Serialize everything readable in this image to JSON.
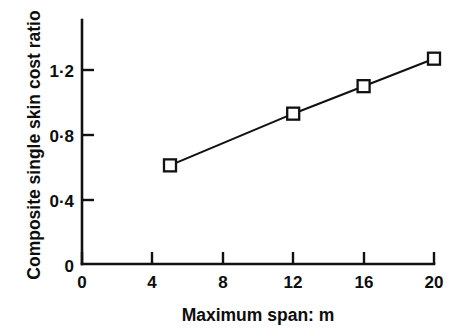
{
  "chart_data": {
    "type": "line",
    "title": "",
    "subtitle": "",
    "xlabel": "Maximum span: m",
    "ylabel": "Composite single skin cost ratio",
    "x": [
      5,
      12,
      16,
      20
    ],
    "values": [
      0.61,
      0.93,
      1.1,
      1.27
    ],
    "series": [
      {
        "name": "Composite single skin cost ratio",
        "x": [
          5,
          12,
          16,
          20
        ],
        "values": [
          0.61,
          0.93,
          1.1,
          1.27
        ]
      }
    ],
    "xlim": [
      0,
      20
    ],
    "ylim": [
      0,
      1.37
    ],
    "xticks": [
      0,
      4,
      8,
      12,
      16,
      20
    ],
    "yticks": [
      0,
      0.4,
      0.8,
      1.2
    ],
    "xtick_labels": [
      "0",
      "4",
      "8",
      "12",
      "16",
      "20"
    ],
    "ytick_labels": [
      "0",
      "0·4",
      "0·8",
      "1·2"
    ],
    "grid": false,
    "legend": false,
    "legend_position": "none",
    "marker": "open-square",
    "line_color": "#111111",
    "marker_fill": "#ffffff",
    "marker_edge_color": "#111111",
    "background_color": "#ffffff",
    "annotations": []
  },
  "axes": {
    "y_title": "Composite single skin cost ratio",
    "x_title": "Maximum span: m",
    "y_tick_labels": [
      {
        "text": "1·2",
        "value": 1.2
      },
      {
        "text": "0·8",
        "value": 0.8
      },
      {
        "text": "0·4",
        "value": 0.4
      },
      {
        "text": "0",
        "value": 0
      }
    ],
    "x_tick_labels": [
      {
        "text": "0",
        "value": 0
      },
      {
        "text": "4",
        "value": 4
      },
      {
        "text": "8",
        "value": 8
      },
      {
        "text": "12",
        "value": 12
      },
      {
        "text": "16",
        "value": 16
      },
      {
        "text": "20",
        "value": 20
      }
    ]
  }
}
